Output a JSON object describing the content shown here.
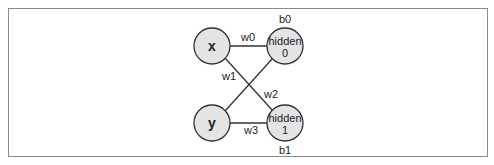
{
  "diagram": {
    "type": "neural-network",
    "colors": {
      "node_fill": "#e4e4e4",
      "node_stroke": "#333333",
      "edge": "#333333",
      "frame": "#8a8a8a"
    },
    "nodes": [
      {
        "id": "x",
        "label": "x",
        "kind": "input"
      },
      {
        "id": "y",
        "label": "y",
        "kind": "input"
      },
      {
        "id": "h0",
        "label_line1": "hidden",
        "label_line2": "0",
        "bias": "b0",
        "kind": "hidden"
      },
      {
        "id": "h1",
        "label_line1": "hidden",
        "label_line2": "1",
        "bias": "b1",
        "kind": "hidden"
      }
    ],
    "edges": [
      {
        "from": "x",
        "to": "h0",
        "label": "w0"
      },
      {
        "from": "x",
        "to": "h1",
        "label": "w1"
      },
      {
        "from": "y",
        "to": "h0",
        "label": "w2"
      },
      {
        "from": "y",
        "to": "h1",
        "label": "w3"
      }
    ]
  }
}
